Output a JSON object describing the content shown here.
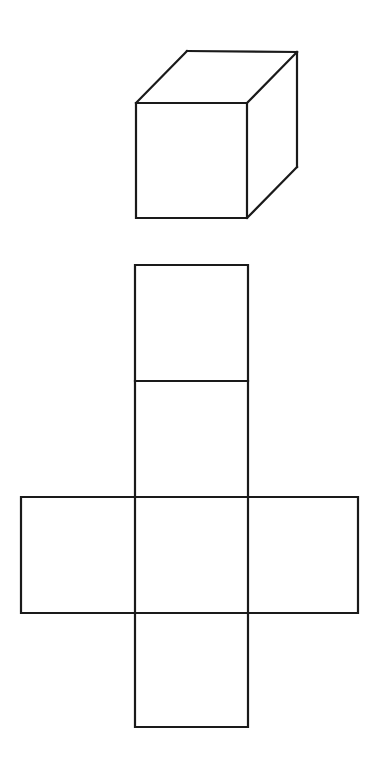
{
  "figure": {
    "background_color": "#ffffff",
    "line_color": "#1a1a1a",
    "face_color": "#ffffff",
    "line_width": 2.2,
    "canvas": {
      "width": 379,
      "height": 764
    }
  },
  "cube": {
    "name": "cube",
    "description": "Line drawing of a cube in oblique/isometric projection",
    "vertices": {
      "front_top_left": [
        136,
        103
      ],
      "front_top_right": [
        247,
        103
      ],
      "front_bottom_right": [
        247,
        218
      ],
      "front_bottom_left": [
        136,
        218
      ],
      "back_top_left": [
        187,
        51
      ],
      "back_top_right": [
        297,
        52
      ],
      "back_bottom_right": [
        297,
        167
      ]
    },
    "faces": {
      "front": "136,103 247,103 247,218 136,218",
      "top": "136,103 187,51 297,52 247,103",
      "right": "247,103 297,52 297,167 247,218"
    },
    "edges": [
      {
        "name": "front-top-edge",
        "from": [
          136,
          103
        ],
        "to": [
          247,
          103
        ]
      },
      {
        "name": "front-right-edge",
        "from": [
          247,
          103
        ],
        "to": [
          247,
          218
        ]
      },
      {
        "name": "front-bottom-edge",
        "from": [
          247,
          218
        ],
        "to": [
          136,
          218
        ]
      },
      {
        "name": "front-left-edge",
        "from": [
          136,
          218
        ],
        "to": [
          136,
          103
        ]
      },
      {
        "name": "top-left-diagonal",
        "from": [
          136,
          103
        ],
        "to": [
          187,
          51
        ]
      },
      {
        "name": "top-back-edge",
        "from": [
          187,
          51
        ],
        "to": [
          297,
          52
        ]
      },
      {
        "name": "top-right-diagonal",
        "from": [
          297,
          52
        ],
        "to": [
          247,
          103
        ]
      },
      {
        "name": "back-right-vertical-edge",
        "from": [
          297,
          52
        ],
        "to": [
          297,
          167
        ]
      },
      {
        "name": "bottom-right-diagonal",
        "from": [
          297,
          167
        ],
        "to": [
          247,
          218
        ]
      }
    ]
  },
  "net": {
    "name": "cube-net",
    "description": "Unfolded cube net arranged as a cross with four stacked squares and one square on each side of the third row",
    "square_size": 113,
    "column_left": 135,
    "column_right": 248,
    "row_y": [
      265,
      381,
      497,
      613,
      727
    ],
    "side_left": 21,
    "side_right": 358,
    "squares": [
      {
        "name": "net-square-top",
        "x": 135,
        "y": 265,
        "width": 113,
        "height": 116,
        "position": "top"
      },
      {
        "name": "net-square-upper-middle",
        "x": 135,
        "y": 381,
        "width": 113,
        "height": 116,
        "position": "upper-middle"
      },
      {
        "name": "net-square-left",
        "x": 21,
        "y": 497,
        "width": 114,
        "height": 116,
        "position": "left"
      },
      {
        "name": "net-square-center",
        "x": 135,
        "y": 497,
        "width": 113,
        "height": 116,
        "position": "center"
      },
      {
        "name": "net-square-right",
        "x": 248,
        "y": 497,
        "width": 110,
        "height": 116,
        "position": "right"
      },
      {
        "name": "net-square-bottom",
        "x": 135,
        "y": 613,
        "width": 113,
        "height": 114,
        "position": "bottom"
      }
    ],
    "outline_path": "M 135 265 L 248 265 L 248 497 L 358 497 L 358 613 L 248 613 L 248 727 L 135 727 L 135 613 L 21 613 L 21 497 L 135 497 Z",
    "fold_lines": [
      {
        "name": "fold-line-top-upper",
        "from": [
          135,
          381
        ],
        "to": [
          248,
          381
        ]
      },
      {
        "name": "fold-line-upper-center",
        "from": [
          135,
          497
        ],
        "to": [
          248,
          497
        ]
      },
      {
        "name": "fold-line-center-bottom",
        "from": [
          135,
          613
        ],
        "to": [
          248,
          613
        ]
      },
      {
        "name": "fold-line-left-vertical",
        "from": [
          135,
          497
        ],
        "to": [
          135,
          613
        ]
      },
      {
        "name": "fold-line-right-vertical",
        "from": [
          248,
          497
        ],
        "to": [
          248,
          613
        ]
      }
    ]
  }
}
